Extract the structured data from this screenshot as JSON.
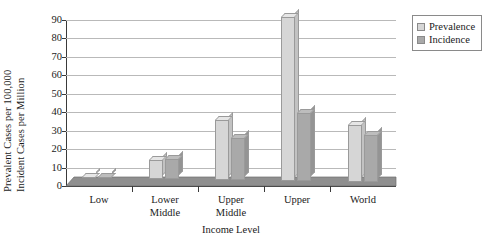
{
  "chart_data": {
    "type": "bar",
    "title": "",
    "subtitle": "",
    "categories": [
      "Low",
      "Lower\nMiddle",
      "Upper\nMiddle",
      "Upper",
      "World"
    ],
    "series": [
      {
        "name": "Prevalence",
        "values": [
          0.4,
          10.5,
          32.5,
          89.0,
          30.5
        ],
        "color": "#d6d6d6"
      },
      {
        "name": "Incidence",
        "values": [
          0.4,
          11.0,
          22.5,
          36.5,
          25.5
        ],
        "color": "#a9a9a9"
      }
    ],
    "xlabel": "Income Level",
    "ylabel_line1": "Prevalent Cases per 100,000",
    "ylabel_line2": "Incident Cases per Million",
    "ylim": [
      0,
      90
    ],
    "ytick_step": 10,
    "yticks": [
      0,
      10,
      20,
      30,
      40,
      50,
      60,
      70,
      80,
      90
    ],
    "grid": true,
    "grid_axis": "y",
    "legend_position": "right-top",
    "style": "3d-bar",
    "axis_color": "#3a3a3a",
    "grid_color": "#b9b9b9",
    "floor_color": "#8f8f8f",
    "background": "#ffffff"
  },
  "legend": {
    "items": [
      {
        "label": "Prevalence",
        "color": "#d6d6d6"
      },
      {
        "label": "Incidence",
        "color": "#a9a9a9"
      }
    ]
  }
}
